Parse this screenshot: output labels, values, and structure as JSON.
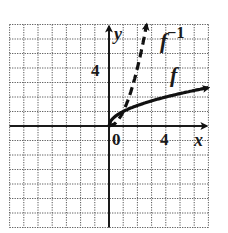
{
  "chart_data": {
    "type": "line",
    "title": "",
    "xlabel": "x",
    "ylabel": "y",
    "xlim": [
      -7,
      7
    ],
    "ylim": [
      -7,
      7
    ],
    "grid": true,
    "grid_style": "dotted",
    "tick_labels": {
      "origin": "0",
      "x": [
        {
          "value": 4,
          "label": "4"
        }
      ],
      "y": [
        {
          "value": 4,
          "label": "4"
        }
      ]
    },
    "series": [
      {
        "name": "f",
        "label": "f",
        "style": "solid",
        "arrow_end": true,
        "x": [
          0,
          0.25,
          1,
          2,
          3,
          4,
          5,
          6,
          7
        ],
        "y": [
          0,
          0.5,
          1,
          1.41,
          1.73,
          2,
          2.24,
          2.45,
          2.65
        ]
      },
      {
        "name": "f^-1",
        "label": "f",
        "superscript": "−1",
        "style": "dashed",
        "arrow_end": true,
        "x": [
          0,
          0.5,
          1,
          1.41,
          1.73,
          2,
          2.24,
          2.45,
          2.65
        ],
        "y": [
          0,
          0.25,
          1,
          2,
          3,
          4,
          5,
          6,
          7
        ]
      }
    ]
  },
  "colors": {
    "axis": "#1a1a1a",
    "grid": "#555555",
    "curve": "#111111",
    "background": "#ffffff"
  }
}
